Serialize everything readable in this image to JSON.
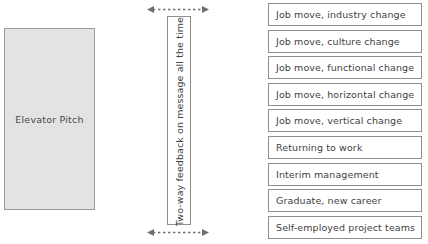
{
  "diagram": {
    "elevator_pitch": {
      "label": "Elevator Pitch",
      "fill_color": "#e3e3e3",
      "border_color": "#9a9a9a"
    },
    "feedback_bar": {
      "label": "Two-way feedback on message all the time",
      "orientation": "vertical-bottom-to-top",
      "border_color": "#8e8e8e"
    },
    "arrows": {
      "top": {
        "name": "dashed-double-headed-arrow",
        "style": "dashed",
        "heads": "both",
        "color": "#6e6e6e"
      },
      "bottom": {
        "name": "dashed-double-headed-arrow",
        "style": "dashed",
        "heads": "both",
        "color": "#6e6e6e"
      }
    },
    "options": {
      "border_color": "#8e8e8e",
      "items": [
        {
          "label": "Job move, industry change"
        },
        {
          "label": "Job move, culture change"
        },
        {
          "label": "Job move, functional change"
        },
        {
          "label": "Job move, horizontal change"
        },
        {
          "label": "Job move, vertical change"
        },
        {
          "label": "Returning to work"
        },
        {
          "label": "Interim management"
        },
        {
          "label": "Graduate, new career"
        },
        {
          "label": "Self-employed project teams"
        }
      ]
    }
  }
}
